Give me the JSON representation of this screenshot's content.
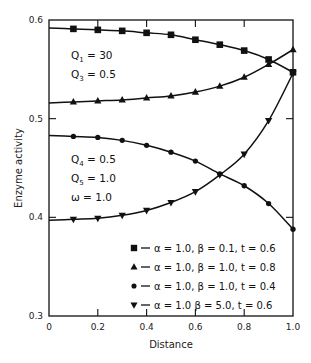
{
  "chart_data": {
    "type": "line",
    "title": "",
    "xlabel": "Distance",
    "ylabel": "Enzyme activity",
    "xlim": [
      0,
      1.0
    ],
    "ylim": [
      0.3,
      0.6
    ],
    "x_ticks": [
      "0",
      "0.2",
      "0.4",
      "0.6",
      "0.8",
      "1.0"
    ],
    "y_ticks": [
      "0.3",
      "0.4",
      "0.5",
      "0.6"
    ],
    "grid": false,
    "legend_position": "lower right (inside plot)",
    "x": [
      0.1,
      0.2,
      0.3,
      0.4,
      0.5,
      0.6,
      0.7,
      0.8,
      0.9,
      1.0
    ],
    "series": [
      {
        "name": "α = 1.0, β = 0.1, t = 0.6",
        "marker": "square",
        "curve_start": 0.592,
        "values": [
          0.591,
          0.59,
          0.589,
          0.587,
          0.585,
          0.58,
          0.575,
          0.569,
          0.56,
          0.547
        ]
      },
      {
        "name": "α = 1.0, β = 1.0, t = 0.8",
        "marker": "triangle-up",
        "curve_start": 0.516,
        "values": [
          0.517,
          0.518,
          0.519,
          0.521,
          0.523,
          0.527,
          0.533,
          0.542,
          0.555,
          0.57
        ]
      },
      {
        "name": "α = 1.0, β = 1.0, t = 0.4",
        "marker": "circle",
        "curve_start": 0.483,
        "values": [
          0.482,
          0.481,
          0.478,
          0.473,
          0.466,
          0.457,
          0.444,
          0.432,
          0.414,
          0.388
        ]
      },
      {
        "name": "α = 1.0  β = 5.0, t = 0.6",
        "marker": "triangle-down",
        "curve_start": 0.397,
        "values": [
          0.398,
          0.399,
          0.402,
          0.407,
          0.415,
          0.426,
          0.443,
          0.464,
          0.498,
          0.546
        ]
      }
    ],
    "annotations": [
      {
        "id": "q1",
        "main": "Q",
        "sub": "1",
        "rest": " =  30",
        "x": 0.09,
        "y": 0.56
      },
      {
        "id": "q3",
        "main": "Q",
        "sub": "3",
        "rest": " =   0.5",
        "x": 0.09,
        "y": 0.541
      },
      {
        "id": "q4",
        "main": "Q",
        "sub": "4",
        "rest": " =   0.5",
        "x": 0.09,
        "y": 0.455
      },
      {
        "id": "q5",
        "main": "Q",
        "sub": "5",
        "rest": " =   1.0",
        "x": 0.09,
        "y": 0.436
      },
      {
        "id": "omega",
        "main": "ω",
        "sub": "",
        "rest": "  =   1.0",
        "x": 0.09,
        "y": 0.417
      }
    ]
  },
  "legend": {
    "items": [
      {
        "marker": "square",
        "text": "α = 1.0,  β = 0.1,  t = 0.6"
      },
      {
        "marker": "triangle-up",
        "text": "α = 1.0,  β = 1.0,  t = 0.8"
      },
      {
        "marker": "circle",
        "text": "α = 1.0,  β = 1.0,  t = 0.4"
      },
      {
        "marker": "triangle-down",
        "text": "α = 1.0   β = 5.0,  t = 0.6"
      }
    ]
  },
  "style": {
    "line_color": "#111111",
    "axis_color": "#222222",
    "background": "#ffffff"
  }
}
